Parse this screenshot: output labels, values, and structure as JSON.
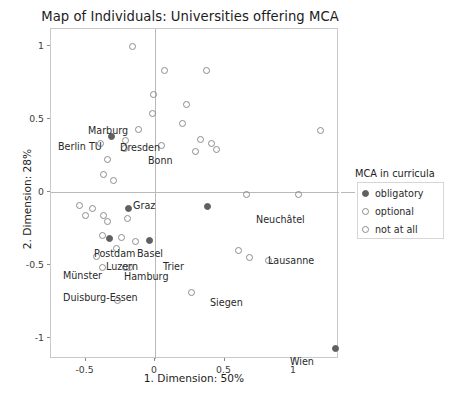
{
  "chart_data": {
    "type": "scatter",
    "title": "Map of Individuals: Universities offering MCA",
    "xlabel": "1. Dimension: 50%",
    "ylabel": "2. Dimension: 28%",
    "xlim": [
      -0.78,
      1.31
    ],
    "ylim": [
      -1.22,
      1.18
    ],
    "xticks": [
      "-0.5",
      "0",
      "0.5",
      "1"
    ],
    "xtick_values": [
      -0.5,
      0,
      0.5,
      1
    ],
    "yticks": [
      "1",
      "0.5",
      "0",
      "-0.5",
      "-1"
    ],
    "ytick_values": [
      1,
      0.5,
      0,
      -0.5,
      -1
    ],
    "grid": false,
    "zero_lines": true,
    "legend": {
      "title": "MCA in curricula",
      "position": "right",
      "entries": [
        {
          "label": "obligatory",
          "marker": "filled"
        },
        {
          "label": "optional",
          "marker": "open"
        },
        {
          "label": "not at all",
          "marker": "open"
        }
      ]
    },
    "points": [
      {
        "x": -0.16,
        "y": 1.0,
        "marker": "open",
        "label": ""
      },
      {
        "x": 0.07,
        "y": 0.83,
        "marker": "open",
        "label": ""
      },
      {
        "x": 0.37,
        "y": 0.83,
        "marker": "open",
        "label": ""
      },
      {
        "x": -0.01,
        "y": 0.67,
        "marker": "open",
        "label": ""
      },
      {
        "x": 0.23,
        "y": 0.6,
        "marker": "open",
        "label": ""
      },
      {
        "x": -0.02,
        "y": 0.54,
        "marker": "open",
        "label": ""
      },
      {
        "x": 0.2,
        "y": 0.47,
        "marker": "open",
        "label": ""
      },
      {
        "x": 1.19,
        "y": 0.42,
        "marker": "open",
        "label": ""
      },
      {
        "x": -0.12,
        "y": 0.43,
        "marker": "open",
        "label": ""
      },
      {
        "x": -0.31,
        "y": 0.38,
        "marker": "filled",
        "label": "Marburg"
      },
      {
        "x": -0.21,
        "y": 0.35,
        "marker": "open",
        "label": "Dresden"
      },
      {
        "x": -0.39,
        "y": 0.33,
        "marker": "open",
        "label": "Berlin TU"
      },
      {
        "x": -0.22,
        "y": 0.3,
        "marker": "open",
        "label": ""
      },
      {
        "x": 0.05,
        "y": 0.32,
        "marker": "open",
        "label": "Bonn"
      },
      {
        "x": 0.33,
        "y": 0.36,
        "marker": "open",
        "label": ""
      },
      {
        "x": 0.41,
        "y": 0.33,
        "marker": "open",
        "label": ""
      },
      {
        "x": 0.44,
        "y": 0.29,
        "marker": "open",
        "label": ""
      },
      {
        "x": 0.29,
        "y": 0.28,
        "marker": "open",
        "label": ""
      },
      {
        "x": -0.34,
        "y": 0.22,
        "marker": "open",
        "label": ""
      },
      {
        "x": -0.37,
        "y": 0.12,
        "marker": "open",
        "label": ""
      },
      {
        "x": -0.3,
        "y": 0.08,
        "marker": "open",
        "label": ""
      },
      {
        "x": -0.54,
        "y": -0.09,
        "marker": "open",
        "label": ""
      },
      {
        "x": -0.45,
        "y": -0.11,
        "marker": "open",
        "label": ""
      },
      {
        "x": -0.19,
        "y": -0.11,
        "marker": "filled",
        "label": "Graz"
      },
      {
        "x": -0.5,
        "y": -0.16,
        "marker": "open",
        "label": ""
      },
      {
        "x": -0.37,
        "y": -0.16,
        "marker": "open",
        "label": ""
      },
      {
        "x": -0.34,
        "y": -0.2,
        "marker": "open",
        "label": ""
      },
      {
        "x": -0.2,
        "y": -0.18,
        "marker": "open",
        "label": ""
      },
      {
        "x": 0.38,
        "y": -0.1,
        "marker": "filled",
        "label": "Neuchâtel"
      },
      {
        "x": 0.66,
        "y": -0.02,
        "marker": "open",
        "label": ""
      },
      {
        "x": 1.03,
        "y": -0.02,
        "marker": "open",
        "label": ""
      },
      {
        "x": -0.38,
        "y": -0.3,
        "marker": "open",
        "label": "Postdam"
      },
      {
        "x": -0.33,
        "y": -0.32,
        "marker": "filled",
        "label": "Luzern"
      },
      {
        "x": -0.24,
        "y": -0.31,
        "marker": "open",
        "label": "Basel"
      },
      {
        "x": -0.14,
        "y": -0.34,
        "marker": "open",
        "label": ""
      },
      {
        "x": -0.04,
        "y": -0.33,
        "marker": "filled",
        "label": "Trier"
      },
      {
        "x": -0.28,
        "y": -0.39,
        "marker": "open",
        "label": "Hamburg"
      },
      {
        "x": -0.42,
        "y": -0.44,
        "marker": "open",
        "label": "Münster"
      },
      {
        "x": -0.38,
        "y": -0.52,
        "marker": "open",
        "label": "Duisburg-Essen"
      },
      {
        "x": -0.21,
        "y": -0.52,
        "marker": "open",
        "label": ""
      },
      {
        "x": -0.18,
        "y": -0.52,
        "marker": "open",
        "label": ""
      },
      {
        "x": 0.6,
        "y": -0.4,
        "marker": "open",
        "label": "Lausanne"
      },
      {
        "x": 0.68,
        "y": -0.45,
        "marker": "open",
        "label": ""
      },
      {
        "x": 0.82,
        "y": -0.47,
        "marker": "open",
        "label": ""
      },
      {
        "x": 0.26,
        "y": -0.69,
        "marker": "open",
        "label": "Siegen"
      },
      {
        "x": -0.27,
        "y": -0.74,
        "marker": "open",
        "label": ""
      },
      {
        "x": 1.3,
        "y": -1.07,
        "marker": "filled",
        "label": "Wien"
      }
    ],
    "labels": [
      {
        "text": "Marburg",
        "x": 88,
        "y": 126
      },
      {
        "text": "Dresden",
        "x": 120,
        "y": 143
      },
      {
        "text": "Berlin TU",
        "x": 58,
        "y": 142
      },
      {
        "text": "Bonn",
        "x": 148,
        "y": 156
      },
      {
        "text": "Graz",
        "x": 133,
        "y": 201
      },
      {
        "text": "Neuchâtel",
        "x": 256,
        "y": 215
      },
      {
        "text": "Postdam",
        "x": 94,
        "y": 249
      },
      {
        "text": "Basel",
        "x": 137,
        "y": 249
      },
      {
        "text": "Luzern",
        "x": 106,
        "y": 262
      },
      {
        "text": "Trier",
        "x": 163,
        "y": 262
      },
      {
        "text": "Hamburg",
        "x": 124,
        "y": 272
      },
      {
        "text": "Münster",
        "x": 63,
        "y": 271
      },
      {
        "text": "Duisburg-Essen",
        "x": 63,
        "y": 293
      },
      {
        "text": "Lausanne",
        "x": 268,
        "y": 256
      },
      {
        "text": "Siegen",
        "x": 210,
        "y": 298
      },
      {
        "text": "Wien",
        "x": 290,
        "y": 357
      }
    ]
  }
}
